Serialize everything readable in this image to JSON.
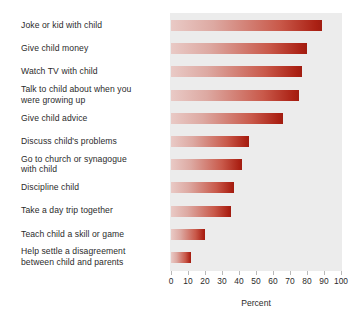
{
  "chart_data": {
    "type": "bar",
    "orientation": "horizontal",
    "title": "",
    "xlabel": "Percent",
    "ylabel": "",
    "xlim": [
      0,
      100
    ],
    "xticks": [
      0,
      10,
      20,
      30,
      40,
      50,
      60,
      70,
      80,
      90,
      100
    ],
    "grid": false,
    "legend": null,
    "categories": [
      "Joke or kid with child",
      "Give child money",
      "Watch TV with child",
      "Talk to child about when you were growing up",
      "Give child advice",
      "Discuss child's problems",
      "Go to church or synagogue with child",
      "Discipline child",
      "Take a day trip together",
      "Teach child a skill or game",
      "Help settle a disagreement between child and parents"
    ],
    "values": [
      89,
      80,
      77,
      75,
      66,
      46,
      42,
      37,
      35,
      20,
      12
    ]
  },
  "labels": {
    "lines": [
      [
        "Joke or kid with child"
      ],
      [
        "Give child money"
      ],
      [
        "Watch TV with child"
      ],
      [
        "Talk to child about when you",
        "were growing up"
      ],
      [
        "Give child advice"
      ],
      [
        "Discuss child's problems"
      ],
      [
        "Go to church or synagogue",
        "with child"
      ],
      [
        "Discipline child"
      ],
      [
        "Take a day trip together"
      ],
      [
        "Teach child a skill or game"
      ],
      [
        "Help settle a disagreement",
        "between child and parents"
      ]
    ]
  },
  "colors": {
    "plot_background": "#ececec",
    "bar_gradient_start": "#e9cac6",
    "bar_gradient_end": "#a01d11",
    "text": "#2b2b2b",
    "tick": "#b9b9b9",
    "page_background": "#ffffff"
  }
}
